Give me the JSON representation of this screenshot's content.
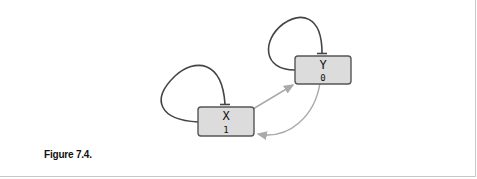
{
  "top_text": "…",
  "caption": "Figure 7.4.",
  "diagram": {
    "nodes": [
      {
        "id": "X",
        "label": "X",
        "value": "1"
      },
      {
        "id": "Y",
        "label": "Y",
        "value": "0"
      }
    ],
    "edges": [
      {
        "from": "X",
        "to": "X",
        "type": "inhibition",
        "color": "#444444"
      },
      {
        "from": "Y",
        "to": "Y",
        "type": "inhibition",
        "color": "#444444"
      },
      {
        "from": "X",
        "to": "Y",
        "type": "activation",
        "color": "#aaaaaa"
      },
      {
        "from": "Y",
        "to": "X",
        "type": "activation",
        "color": "#aaaaaa"
      }
    ],
    "colors": {
      "node_fill": "#dcdcdc",
      "node_stroke": "#555555"
    }
  }
}
